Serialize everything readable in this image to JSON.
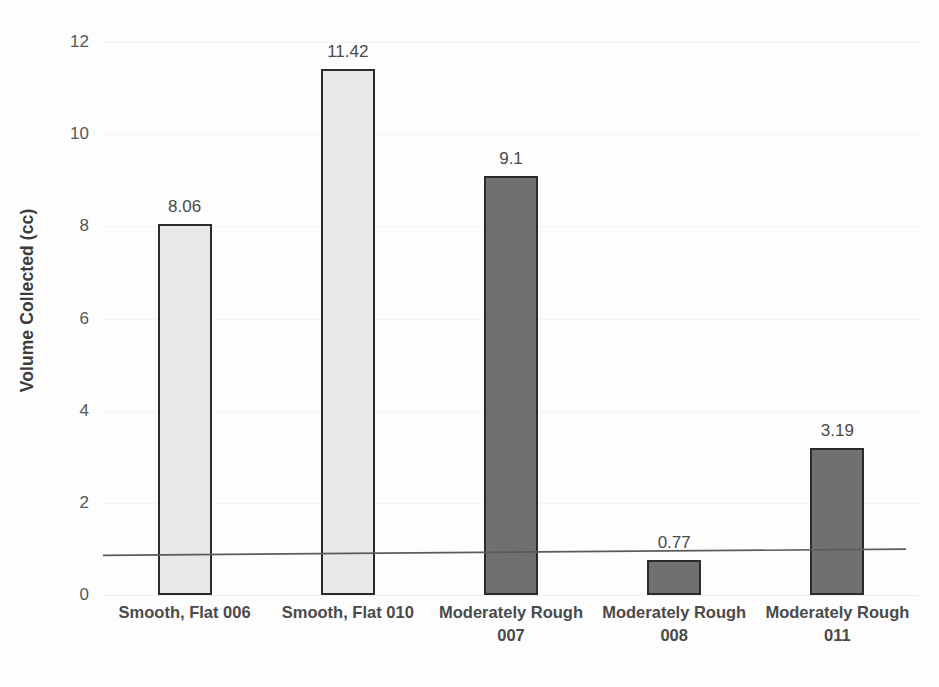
{
  "chart_data": {
    "type": "bar",
    "title": "",
    "xlabel": "",
    "ylabel": "Volume Collected (cc)",
    "categories": [
      "Smooth, Flat 006",
      "Smooth, Flat 010",
      "Moderately Rough 007",
      "Moderately Rough 008",
      "Moderately Rough 011"
    ],
    "values": [
      8.06,
      11.42,
      9.1,
      0.77,
      3.19
    ],
    "value_labels": [
      "8.06",
      "11.42",
      "9.1",
      "0.77",
      "3.19"
    ],
    "bar_styles": [
      "light",
      "light",
      "dark",
      "dark",
      "dark"
    ],
    "ylim": [
      0,
      12
    ],
    "yticks": [
      0,
      2,
      4,
      6,
      8,
      10,
      12
    ],
    "ytick_labels": [
      "0",
      "2",
      "4",
      "6",
      "8",
      "10",
      "12"
    ],
    "grid": true,
    "legend": "none",
    "annotations": [
      {
        "name": "horizontal-scan-line",
        "description": "thin dark horizontal line crossing the full plot width near value 0.9"
      }
    ]
  },
  "colors": {
    "bar_light_fill": "#e9e9e9",
    "bar_dark_fill": "#707070",
    "bar_outline": "#2b2b2b",
    "gridline": "#f0f0f0",
    "text": "#4a4a4a",
    "tick_text": "#565656",
    "background": "#fdfdfd"
  },
  "axis": {
    "y_title": "Volume Collected (cc)"
  }
}
